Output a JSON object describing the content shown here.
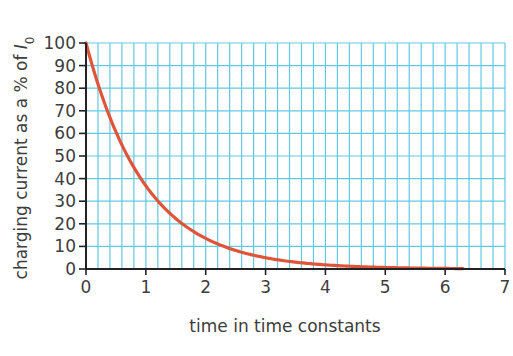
{
  "chart_data": {
    "type": "line",
    "title": "",
    "xlabel": "time in time constants",
    "ylabel": "charging current as a % of I0",
    "ylabel_parts": {
      "text": "charging current as a % of ",
      "symbol": "I",
      "subscript": "0"
    },
    "xlim": [
      0,
      7
    ],
    "ylim": [
      0,
      100
    ],
    "x_ticks": [
      0,
      1,
      2,
      3,
      4,
      5,
      6,
      7
    ],
    "y_ticks": [
      0,
      10,
      20,
      30,
      40,
      50,
      60,
      70,
      80,
      90,
      100
    ],
    "grid": {
      "on": true,
      "x_minor_step": 0.2,
      "y_step": 10
    },
    "legend": null,
    "series": [
      {
        "name": "charging current",
        "function": "100*exp(-t)",
        "x": [
          0,
          0.25,
          0.5,
          0.75,
          1,
          1.25,
          1.5,
          1.75,
          2,
          2.5,
          3,
          3.5,
          4,
          4.5,
          5,
          5.5,
          6,
          6.3
        ],
        "values": [
          100,
          77.9,
          60.7,
          47.2,
          36.8,
          28.7,
          22.3,
          17.4,
          13.5,
          8.2,
          5.0,
          3.0,
          1.8,
          1.1,
          0.7,
          0.4,
          0.2,
          0.2
        ]
      }
    ]
  },
  "colors": {
    "curve": "#e0553a",
    "grid": "#62c9e2",
    "axis": "#222222",
    "text": "#3d3d3d"
  },
  "layout": {
    "plot_left": 86,
    "plot_right": 505,
    "plot_top": 43,
    "plot_bottom": 269
  }
}
